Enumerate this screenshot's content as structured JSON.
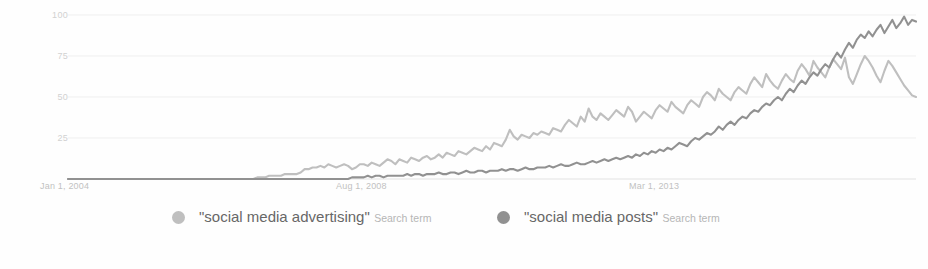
{
  "chart_data": {
    "type": "line",
    "title": "",
    "xlabel": "",
    "ylabel": "",
    "ylim": [
      0,
      100
    ],
    "yticks": [
      0,
      25,
      50,
      75,
      100
    ],
    "ytick_labels": [
      "",
      "25",
      "50",
      "75",
      "100"
    ],
    "xtick_labels": [
      "Jan 1, 2004",
      "Aug 1, 2008",
      "Mar 1, 2013"
    ],
    "grid": true,
    "legend_position": "bottom",
    "x_start": "Jan 1, 2004",
    "x_end": "2018",
    "series": [
      {
        "name": "\"social media advertising\"",
        "sublabel": "Search term",
        "color": "#b3b3b3",
        "values": [
          0,
          0,
          0,
          0,
          0,
          0,
          0,
          0,
          0,
          0,
          0,
          0,
          0,
          0,
          0,
          0,
          0,
          0,
          0,
          0,
          0,
          0,
          0,
          0,
          0,
          0,
          0,
          0,
          0,
          0,
          0,
          0,
          0,
          0,
          0,
          0,
          0,
          0,
          0,
          0,
          0,
          0,
          0,
          0,
          0,
          0,
          0,
          0,
          1,
          1,
          1,
          2,
          2,
          2,
          2,
          3,
          3,
          3,
          3,
          4,
          6,
          6,
          7,
          7,
          8,
          7,
          9,
          8,
          7,
          8,
          9,
          8,
          6,
          7,
          9,
          9,
          8,
          10,
          9,
          8,
          10,
          12,
          11,
          9,
          12,
          11,
          10,
          13,
          12,
          11,
          13,
          14,
          12,
          13,
          15,
          13,
          16,
          15,
          14,
          17,
          16,
          15,
          17,
          19,
          18,
          17,
          20,
          18,
          22,
          21,
          20,
          24,
          30,
          26,
          24,
          27,
          26,
          25,
          28,
          27,
          29,
          28,
          27,
          31,
          30,
          29,
          33,
          36,
          34,
          32,
          38,
          35,
          43,
          38,
          36,
          40,
          38,
          36,
          39,
          42,
          40,
          38,
          44,
          41,
          35,
          38,
          41,
          39,
          37,
          42,
          45,
          43,
          41,
          47,
          44,
          42,
          40,
          45,
          48,
          46,
          44,
          50,
          53,
          51,
          48,
          55,
          52,
          50,
          48,
          53,
          56,
          54,
          52,
          58,
          62,
          59,
          56,
          64,
          60,
          57,
          55,
          60,
          64,
          61,
          59,
          66,
          70,
          67,
          63,
          72,
          68,
          65,
          62,
          68,
          73,
          70,
          67,
          74,
          62,
          58,
          64,
          70,
          75,
          72,
          68,
          63,
          59,
          66,
          72,
          69,
          65,
          61,
          57,
          54,
          51,
          50
        ]
      },
      {
        "name": "\"social media posts\"",
        "sublabel": "Search term",
        "color": "#7d7d7d",
        "values": [
          0,
          0,
          0,
          0,
          0,
          0,
          0,
          0,
          0,
          0,
          0,
          0,
          0,
          0,
          0,
          0,
          0,
          0,
          0,
          0,
          0,
          0,
          0,
          0,
          0,
          0,
          0,
          0,
          0,
          0,
          0,
          0,
          0,
          0,
          0,
          0,
          0,
          0,
          0,
          0,
          0,
          0,
          0,
          0,
          0,
          0,
          0,
          0,
          0,
          0,
          0,
          0,
          0,
          0,
          0,
          0,
          0,
          0,
          0,
          0,
          0,
          0,
          0,
          0,
          0,
          0,
          0,
          0,
          0,
          0,
          0,
          0,
          1,
          1,
          1,
          1,
          2,
          1,
          2,
          2,
          1,
          2,
          2,
          2,
          2,
          2,
          3,
          2,
          3,
          3,
          2,
          3,
          3,
          3,
          4,
          3,
          3,
          4,
          4,
          3,
          4,
          5,
          4,
          4,
          5,
          5,
          4,
          5,
          5,
          5,
          6,
          5,
          6,
          6,
          5,
          6,
          7,
          6,
          6,
          7,
          7,
          7,
          8,
          7,
          8,
          9,
          8,
          8,
          9,
          10,
          9,
          9,
          10,
          11,
          10,
          11,
          12,
          11,
          12,
          13,
          12,
          13,
          14,
          13,
          15,
          14,
          16,
          15,
          17,
          16,
          18,
          17,
          19,
          18,
          20,
          22,
          21,
          20,
          23,
          25,
          24,
          26,
          28,
          27,
          29,
          32,
          30,
          33,
          35,
          33,
          36,
          38,
          37,
          40,
          42,
          41,
          44,
          46,
          45,
          48,
          50,
          48,
          52,
          55,
          53,
          57,
          60,
          58,
          62,
          65,
          63,
          67,
          70,
          68,
          73,
          77,
          74,
          79,
          83,
          80,
          85,
          88,
          86,
          90,
          87,
          91,
          94,
          89,
          93,
          97,
          92,
          95,
          99,
          94,
          97,
          96
        ]
      }
    ]
  },
  "axis": {
    "y_tick_100": "100",
    "y_tick_75": "75",
    "y_tick_50": "50",
    "y_tick_25": "25",
    "x_tick_1": "Jan 1, 2004",
    "x_tick_2": "Aug 1, 2008",
    "x_tick_3": "Mar 1, 2013"
  },
  "legend": {
    "item1": {
      "term": "\"social media advertising\"",
      "sublabel": "Search term",
      "color": "#b3b3b3"
    },
    "item2": {
      "term": "\"social media posts\"",
      "sublabel": "Search term",
      "color": "#7d7d7d"
    }
  }
}
